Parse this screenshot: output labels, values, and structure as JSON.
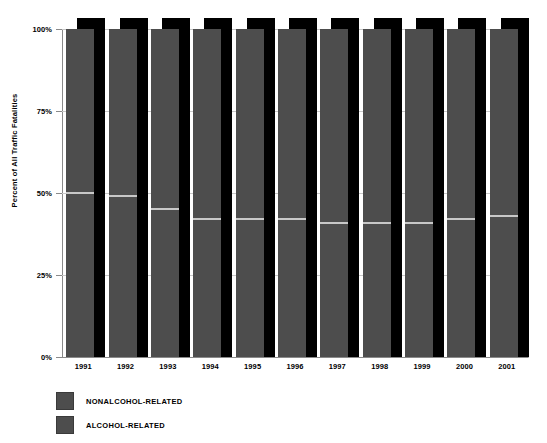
{
  "top_strip_text": "",
  "axis": {
    "y_title": "Percent of All Traffic Fatalities",
    "y_ticks": [
      "0%",
      "25%",
      "50%",
      "75%",
      "100%"
    ]
  },
  "legend": {
    "items": [
      {
        "label": "NONALCOHOL-RELATED",
        "color": "#4d4d4d"
      },
      {
        "label": "ALCOHOL-RELATED",
        "color": "#4d4d4d"
      }
    ]
  },
  "chart_data": {
    "type": "bar",
    "title": "",
    "xlabel": "",
    "ylabel": "Percent of All Traffic Fatalities",
    "ylim": [
      0,
      100
    ],
    "yticks": [
      0,
      25,
      50,
      75,
      100
    ],
    "ytick_labels": [
      "0%",
      "25%",
      "50%",
      "75%",
      "100%"
    ],
    "grid": true,
    "stacked": true,
    "stack_total": 100,
    "legend_position": "bottom-left",
    "categories": [
      "1991",
      "1992",
      "1993",
      "1994",
      "1995",
      "1996",
      "1997",
      "1998",
      "1999",
      "2000",
      "2001"
    ],
    "series": [
      {
        "name": "NONALCOHOL-RELATED",
        "color": "#4d4d4d",
        "values": [
          50,
          51,
          55,
          58,
          58,
          58,
          59,
          59,
          59,
          58,
          57
        ]
      },
      {
        "name": "ALCOHOL-RELATED",
        "color": "#4d4d4d",
        "values": [
          50,
          49,
          45,
          42,
          42,
          42,
          41,
          41,
          41,
          42,
          43
        ]
      }
    ]
  }
}
